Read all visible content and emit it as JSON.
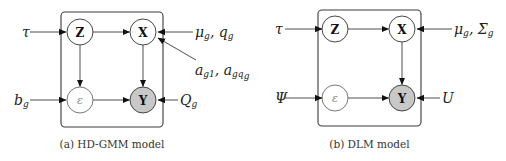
{
  "panels": [
    {
      "id": "a",
      "caption": "(a) HD-GMM model",
      "plate": {
        "x": 61,
        "y": 12,
        "w": 102,
        "h": 115,
        "r": 4
      },
      "nodes": [
        {
          "id": "Z",
          "label": "Z",
          "cx": 80,
          "cy": 32,
          "r": 13,
          "type": "latent"
        },
        {
          "id": "X",
          "label": "X",
          "cx": 143,
          "cy": 32,
          "r": 13,
          "type": "latent"
        },
        {
          "id": "eps",
          "label": "ε",
          "cx": 80,
          "cy": 100,
          "r": 13,
          "type": "faint"
        },
        {
          "id": "Y",
          "label": "Y",
          "cx": 143,
          "cy": 100,
          "r": 13,
          "type": "observed"
        }
      ],
      "edges": [
        {
          "from": "Z",
          "to": "X"
        },
        {
          "from": "Z",
          "to": "eps"
        },
        {
          "from": "X",
          "to": "Y"
        },
        {
          "from": "eps",
          "to": "Y"
        }
      ],
      "params": [
        {
          "label": "τ",
          "x": 22,
          "y": 32,
          "target": [
            66,
            32
          ],
          "start": [
            30,
            32
          ]
        },
        {
          "label": "b",
          "sub": "g",
          "x": 14,
          "y": 100,
          "target": [
            66,
            100
          ],
          "start": [
            30,
            100
          ]
        },
        {
          "label": "μ",
          "sub": "g",
          "extra": ", q",
          "extra_sub": "g",
          "x": 195,
          "y": 32,
          "target": [
            158,
            32
          ],
          "start": [
            193,
            32
          ]
        },
        {
          "label": "a",
          "sub": "g1",
          "extra": ", a",
          "extra_sub": "gq",
          "extra_sub2": "g",
          "x": 195,
          "y": 70,
          "target": [
            158,
            38
          ],
          "start": [
            196,
            60
          ]
        },
        {
          "label": "Q",
          "sub": "g",
          "x": 180,
          "y": 100,
          "target": [
            158,
            100
          ],
          "start": [
            178,
            100
          ]
        }
      ]
    },
    {
      "id": "b",
      "caption": "(b) DLM model",
      "plate": {
        "x": 318,
        "y": 10,
        "w": 103,
        "h": 116,
        "r": 4
      },
      "nodes": [
        {
          "id": "Z",
          "label": "Z",
          "cx": 335,
          "cy": 29,
          "r": 13,
          "type": "latent"
        },
        {
          "id": "X",
          "label": "X",
          "cx": 402,
          "cy": 29,
          "r": 13,
          "type": "latent"
        },
        {
          "id": "eps",
          "label": "ε",
          "cx": 335,
          "cy": 98,
          "r": 13,
          "type": "faint"
        },
        {
          "id": "Y",
          "label": "Y",
          "cx": 402,
          "cy": 98,
          "r": 13,
          "type": "observed"
        }
      ],
      "edges": [
        {
          "from": "Z",
          "to": "X"
        },
        {
          "from": "X",
          "to": "Y"
        },
        {
          "from": "eps",
          "to": "Y"
        }
      ],
      "params": [
        {
          "label": "τ",
          "x": 275,
          "y": 29,
          "target": [
            322,
            29
          ],
          "start": [
            285,
            29
          ]
        },
        {
          "label": "Ψ",
          "x": 275,
          "y": 98,
          "target": [
            322,
            98
          ],
          "start": [
            285,
            98
          ],
          "upright": true
        },
        {
          "label": "μ",
          "sub": "g",
          "extra": ", Σ",
          "extra_sub": "g",
          "x": 454,
          "y": 29,
          "target": [
            417,
            29
          ],
          "start": [
            452,
            29
          ]
        },
        {
          "label": "U",
          "x": 442,
          "y": 98,
          "target": [
            417,
            98
          ],
          "start": [
            440,
            98
          ]
        }
      ]
    }
  ]
}
